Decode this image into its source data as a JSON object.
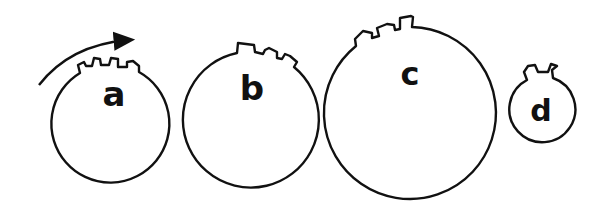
{
  "diagram": {
    "wheels": [
      {
        "label": "a",
        "relative_size": "medium-small",
        "teeth": 3,
        "teeth_position": "top"
      },
      {
        "label": "b",
        "relative_size": "medium",
        "teeth": 3,
        "teeth_position": "top-right"
      },
      {
        "label": "c",
        "relative_size": "large",
        "teeth": 3,
        "teeth_position": "top-left"
      },
      {
        "label": "d",
        "relative_size": "small",
        "teeth": 2,
        "teeth_position": "top"
      }
    ],
    "arrow": {
      "direction": "clockwise",
      "attached_to": "a"
    },
    "colors": {
      "stroke": "#111111",
      "background": "#ffffff"
    }
  }
}
